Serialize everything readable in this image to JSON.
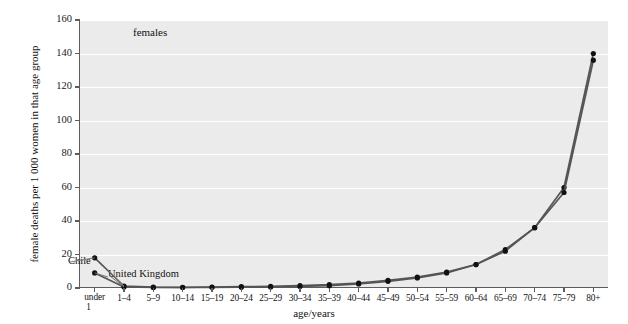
{
  "chart_data": {
    "type": "line",
    "title": "females",
    "xlabel": "age/years",
    "ylabel": "female deaths per 1 000 women in that age group",
    "ylim": [
      0,
      160
    ],
    "yticks": [
      0,
      20,
      40,
      60,
      80,
      100,
      120,
      140,
      160
    ],
    "grid": true,
    "legend_position": "inline-annotations",
    "categories": [
      "under 1",
      "1–4",
      "5–9",
      "10–14",
      "15–19",
      "20–24",
      "25–29",
      "30–34",
      "35–39",
      "40–44",
      "45–49",
      "50–54",
      "55–59",
      "60–64",
      "65–69",
      "70–74",
      "75–79",
      "80+"
    ],
    "series": [
      {
        "name": "Chile",
        "color": "#555555",
        "values": [
          18,
          1.2,
          0.5,
          0.4,
          0.6,
          0.8,
          1.0,
          1.4,
          2.0,
          3.0,
          4.5,
          6.5,
          9.5,
          14,
          23,
          36,
          60,
          140
        ]
      },
      {
        "name": "United Kingdom",
        "color": "#555555",
        "values": [
          9,
          0.6,
          0.3,
          0.3,
          0.4,
          0.5,
          0.6,
          0.9,
          1.4,
          2.4,
          4.0,
          6.0,
          9.0,
          14,
          22,
          36,
          57,
          136
        ]
      }
    ],
    "annotations": [
      {
        "text": "Chile",
        "target_series": "Chile"
      },
      {
        "text": "United Kingdom",
        "target_series": "United Kingdom"
      }
    ]
  },
  "colors": {
    "plot_background": "#ebebeb",
    "gridline": "#ffffff",
    "axis": "#5d5d5d",
    "series_line": "#555555",
    "marker": "#111111",
    "text": "#111111"
  }
}
